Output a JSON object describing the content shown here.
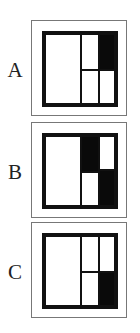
{
  "options": [
    {
      "label": "A",
      "top": 20,
      "cells": [
        {
          "name": "left-tall-cell",
          "x": 0,
          "y": 0,
          "w": 38,
          "h": 72,
          "filled": false
        },
        {
          "name": "top-middle-cell",
          "x": 36,
          "y": 0,
          "w": 20,
          "h": 38,
          "filled": false
        },
        {
          "name": "top-right-cell",
          "x": 54,
          "y": 0,
          "w": 18,
          "h": 38,
          "filled": true
        },
        {
          "name": "bottom-middle-cell",
          "x": 36,
          "y": 36,
          "w": 20,
          "h": 36,
          "filled": false
        },
        {
          "name": "bottom-right-cell",
          "x": 54,
          "y": 36,
          "w": 18,
          "h": 36,
          "filled": false
        }
      ]
    },
    {
      "label": "B",
      "top": 122,
      "cells": [
        {
          "name": "left-tall-cell",
          "x": 0,
          "y": 0,
          "w": 38,
          "h": 72,
          "filled": false
        },
        {
          "name": "top-middle-cell",
          "x": 36,
          "y": 0,
          "w": 20,
          "h": 38,
          "filled": true
        },
        {
          "name": "top-right-cell",
          "x": 54,
          "y": 0,
          "w": 18,
          "h": 36,
          "filled": false
        },
        {
          "name": "bottom-middle-cell",
          "x": 36,
          "y": 36,
          "w": 20,
          "h": 36,
          "filled": false
        },
        {
          "name": "bottom-right-cell",
          "x": 54,
          "y": 34,
          "w": 18,
          "h": 38,
          "filled": true
        }
      ]
    },
    {
      "label": "C",
      "top": 222,
      "cells": [
        {
          "name": "left-tall-cell",
          "x": 0,
          "y": 0,
          "w": 38,
          "h": 72,
          "filled": false
        },
        {
          "name": "top-middle-cell",
          "x": 36,
          "y": 0,
          "w": 20,
          "h": 38,
          "filled": false
        },
        {
          "name": "top-right-cell",
          "x": 54,
          "y": 0,
          "w": 18,
          "h": 38,
          "filled": false
        },
        {
          "name": "bottom-middle-cell",
          "x": 36,
          "y": 36,
          "w": 20,
          "h": 36,
          "filled": false
        },
        {
          "name": "bottom-right-cell",
          "x": 54,
          "y": 36,
          "w": 18,
          "h": 36,
          "filled": true
        }
      ]
    }
  ],
  "colors": {
    "stroke": "#111111",
    "fill": "#0a0a0a",
    "frame": "#777777",
    "background": "#ffffff"
  }
}
